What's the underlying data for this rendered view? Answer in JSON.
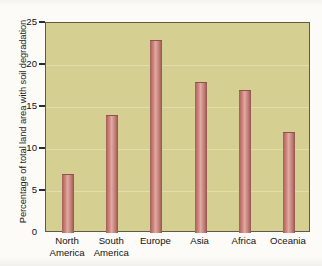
{
  "chart_data": {
    "type": "bar",
    "title": "",
    "xlabel": "",
    "ylabel": "Percentage of total land area with soil degradation",
    "categories": [
      "North America",
      "South America",
      "Europe",
      "Asia",
      "Africa",
      "Oceania"
    ],
    "category_lines": [
      [
        "North",
        "America"
      ],
      [
        "South",
        "America"
      ],
      [
        "Europe",
        ""
      ],
      [
        "Asia",
        ""
      ],
      [
        "Africa",
        ""
      ],
      [
        "Oceania",
        ""
      ]
    ],
    "values": [
      7,
      14,
      23,
      18,
      17,
      12
    ],
    "ylim": [
      0,
      25
    ],
    "yticks": [
      0,
      5,
      10,
      15,
      20,
      25
    ],
    "ytick_labels": [
      "0",
      "5",
      "10",
      "15",
      "20",
      "25"
    ],
    "grid": true,
    "legend": "none"
  },
  "colors": {
    "plot_background": "#d5cf92",
    "bar": "#c87f78",
    "bar_highlight": "#e0a9a1",
    "bar_shadow": "#8e534c",
    "axis": "#2c2c2c",
    "gridline": "#e4e0ae",
    "page_background": "#fcfbf8",
    "text": "#111111"
  }
}
